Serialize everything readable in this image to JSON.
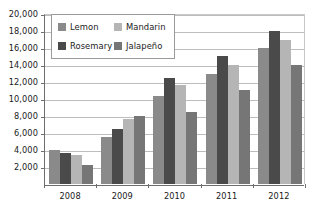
{
  "chart_data": {
    "type": "bar",
    "title": "",
    "subtitle": "",
    "xlabel": "",
    "ylabel": "",
    "categories": [
      "2008",
      "2009",
      "2010",
      "2011",
      "2012"
    ],
    "series": [
      {
        "name": "Lemon",
        "color": "#8a8a8a",
        "values": [
          4000,
          5500,
          10400,
          13000,
          16000
        ]
      },
      {
        "name": "Rosemary",
        "color": "#4a4a4a",
        "values": [
          3600,
          6450,
          12500,
          15050,
          18050
        ]
      },
      {
        "name": "Mandarin",
        "color": "#b5b5b5",
        "values": [
          3400,
          7650,
          11700,
          14000,
          17000
        ]
      },
      {
        "name": "Jalapeño",
        "color": "#767676",
        "values": [
          2200,
          8000,
          8450,
          11100,
          14000
        ]
      }
    ],
    "ylim": [
      0,
      20000
    ],
    "ytick_step": 2000,
    "ytick_labels": [
      "20,000",
      "18,000",
      "16,000",
      "14,000",
      "12,000",
      "10,000",
      "8,000",
      "6,000",
      "4,000",
      "2,000"
    ],
    "ytick_values": [
      20000,
      18000,
      16000,
      14000,
      12000,
      10000,
      8000,
      6000,
      4000,
      2000
    ],
    "grid": true,
    "grid_axis": "y",
    "legend_position": "top-left-inside",
    "legend_order": [
      "Lemon",
      "Mandarin",
      "Rosemary",
      "Jalapeño"
    ],
    "bar_order": [
      "Lemon",
      "Rosemary",
      "Mandarin",
      "Jalapeño"
    ]
  },
  "legend": {
    "entries": [
      {
        "label": "Lemon",
        "color": "#8a8a8a"
      },
      {
        "label": "Mandarin",
        "color": "#b5b5b5"
      },
      {
        "label": "Rosemary",
        "color": "#4a4a4a"
      },
      {
        "label": "Jalapeño",
        "color": "#767676"
      }
    ]
  }
}
